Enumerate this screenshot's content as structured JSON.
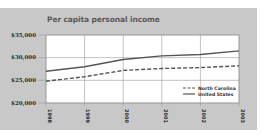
{
  "chart_data": {
    "type": "line",
    "title": "Per capita personal income",
    "xlabel": "",
    "ylabel": "",
    "x": [
      "1998",
      "1999",
      "2000",
      "2001",
      "2002",
      "2003"
    ],
    "y_ticks": [
      "$20,000",
      "$25,000",
      "$30,000",
      "$35,000"
    ],
    "y_tick_values": [
      20000,
      25000,
      30000,
      35000
    ],
    "ylim": [
      20000,
      35000
    ],
    "grid": true,
    "legend_position": "lower right inside plot",
    "series": [
      {
        "name": "North Carolina",
        "style": "dashed",
        "color": "#555555",
        "values": [
          24800,
          25800,
          27200,
          27600,
          27800,
          28200
        ]
      },
      {
        "name": "United States",
        "style": "solid",
        "color": "#555555",
        "values": [
          27000,
          28000,
          29600,
          30400,
          30700,
          31500
        ]
      }
    ]
  },
  "colors": {
    "panel_bg": "#c8c8c8",
    "plot_bg": "#ffffff",
    "grid": "#9a9a9a",
    "line": "#555555"
  }
}
